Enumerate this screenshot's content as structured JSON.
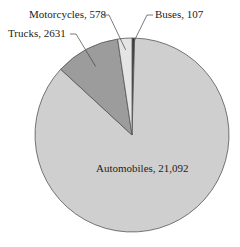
{
  "chart_data": {
    "type": "pie",
    "title": "",
    "categories": [
      "Automobiles",
      "Trucks",
      "Motorcycles",
      "Buses"
    ],
    "values": [
      21092,
      2631,
      578,
      107
    ],
    "labels": [
      "Automobiles, 21,092",
      "Trucks, 2631",
      "Motorcycles, 578",
      "Buses, 107"
    ],
    "colors": [
      "#cfcfcf",
      "#9c9c9c",
      "#e4e4e4",
      "#3a3a3a"
    ],
    "legend": "none (direct labels)",
    "start_angle_deg": 0,
    "direction": "clockwise"
  }
}
